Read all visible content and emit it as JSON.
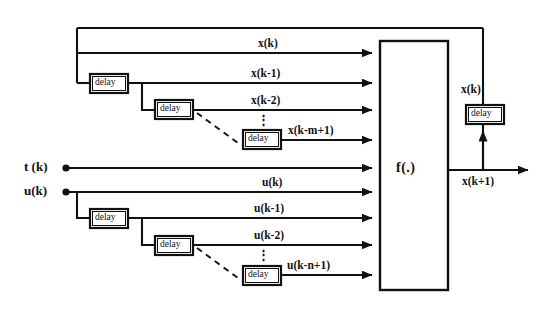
{
  "diagram": {
    "function_block": {
      "label": "f(.)"
    },
    "inputs": [
      {
        "name": "t-input",
        "label": "t (k)"
      },
      {
        "name": "u-input",
        "label": "u(k)"
      }
    ],
    "state_signals": [
      {
        "label": "x(k)"
      },
      {
        "label": "x(k-1)"
      },
      {
        "label": "x(k-2)"
      },
      {
        "label": "x(k-m+1)"
      }
    ],
    "input_signals": [
      {
        "label": "u(k)"
      },
      {
        "label": "u(k-1)"
      },
      {
        "label": "u(k-2)"
      },
      {
        "label": "u(k-n+1)"
      }
    ],
    "feedback": {
      "state_label": "x(k)",
      "output_label": "x(k+1)",
      "delay_label": "delay"
    },
    "delay_label": "delay",
    "vertical_ellipsis": "⋮",
    "delay_blocks": [
      {
        "name": "x-delay-1",
        "label": "delay"
      },
      {
        "name": "x-delay-2",
        "label": "delay"
      },
      {
        "name": "x-delay-m",
        "label": "delay"
      },
      {
        "name": "u-delay-1",
        "label": "delay"
      },
      {
        "name": "u-delay-2",
        "label": "delay"
      },
      {
        "name": "u-delay-n",
        "label": "delay"
      }
    ],
    "colors": {
      "line": "#111111",
      "background": "#ffffff",
      "text": "#111111"
    }
  }
}
